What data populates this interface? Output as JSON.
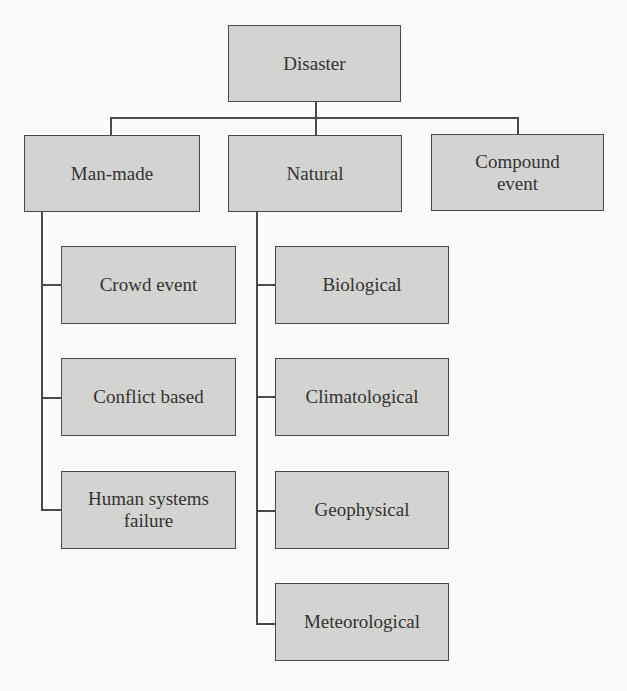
{
  "diagram": {
    "type": "hierarchy",
    "colors": {
      "node_fill": "#d3d3d1",
      "node_border": "#4a4a4a",
      "text": "#333333",
      "background": "#fbfbfa"
    },
    "root": {
      "label": "Disaster"
    },
    "categories": [
      {
        "label": "Man-made",
        "children": [
          {
            "label": "Crowd event"
          },
          {
            "label": "Conflict based"
          },
          {
            "label": "Human systems failure"
          }
        ]
      },
      {
        "label": "Natural",
        "children": [
          {
            "label": "Biological"
          },
          {
            "label": "Climatological"
          },
          {
            "label": "Geophysical"
          },
          {
            "label": "Meteorological"
          }
        ]
      },
      {
        "label": "Compound event",
        "children": []
      }
    ]
  }
}
